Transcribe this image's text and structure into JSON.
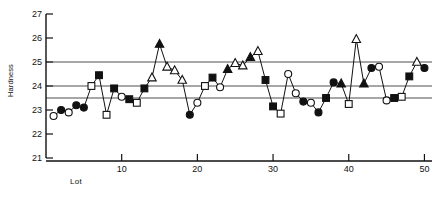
{
  "chart_data": {
    "type": "line",
    "title": "",
    "subtitle": "",
    "xlabel": "Lot",
    "ylabel": "Hardness",
    "xlim": [
      0,
      51
    ],
    "ylim": [
      21,
      27
    ],
    "ytick_labels": [
      "21",
      "22",
      "23",
      "24",
      "25",
      "26",
      "27"
    ],
    "ytick_values": [
      21,
      22,
      23,
      24,
      25,
      26,
      27
    ],
    "xtick_labels": [
      "10",
      "20",
      "30",
      "40",
      "50"
    ],
    "xtick_values": [
      10,
      20,
      30,
      40,
      50
    ],
    "grid": "horizontal-reference-lines-only",
    "legend": "none",
    "reference_lines": [
      {
        "name": "upper-control-limit",
        "value": 25.0
      },
      {
        "name": "center-line",
        "value": 24.0
      },
      {
        "name": "lower-reference-line",
        "value": 23.5
      }
    ],
    "marker_cycle": [
      "open-circle",
      "filled-circle",
      "open-square",
      "filled-square",
      "open-triangle",
      "filled-triangle"
    ],
    "x": [
      1,
      2,
      3,
      4,
      5,
      6,
      7,
      8,
      9,
      10,
      11,
      12,
      13,
      14,
      15,
      16,
      17,
      18,
      19,
      20,
      21,
      22,
      23,
      24,
      25,
      26,
      27,
      28,
      29,
      30,
      31,
      32,
      33,
      34,
      35,
      36,
      37,
      38,
      39,
      40,
      41,
      42,
      43,
      44,
      45,
      46,
      47,
      48,
      49,
      50
    ],
    "values": [
      22.75,
      23.0,
      22.9,
      23.2,
      23.1,
      24.0,
      24.45,
      22.8,
      23.9,
      23.55,
      23.45,
      23.3,
      23.9,
      24.35,
      25.75,
      24.8,
      24.65,
      24.25,
      22.8,
      23.3,
      24.0,
      24.35,
      23.95,
      24.7,
      24.95,
      24.85,
      25.2,
      25.45,
      24.25,
      23.15,
      22.85,
      24.5,
      23.7,
      23.35,
      23.3,
      22.9,
      23.5,
      24.15,
      24.1,
      23.25,
      25.95,
      24.1,
      24.75,
      24.8,
      23.4,
      23.5,
      23.55,
      24.4,
      25.0,
      24.75
    ],
    "markers": [
      "open-circle",
      "filled-circle",
      "open-circle",
      "filled-circle",
      "filled-circle",
      "open-square",
      "filled-square",
      "open-square",
      "filled-square",
      "open-circle",
      "filled-square",
      "open-square",
      "filled-square",
      "open-triangle",
      "filled-triangle",
      "open-triangle",
      "open-triangle",
      "open-triangle",
      "filled-circle",
      "open-circle",
      "open-square",
      "filled-square",
      "open-circle",
      "filled-triangle",
      "open-triangle",
      "open-triangle",
      "filled-triangle",
      "open-triangle",
      "filled-square",
      "filled-square",
      "open-square",
      "open-circle",
      "open-circle",
      "filled-circle",
      "open-circle",
      "filled-circle",
      "filled-square",
      "filled-circle",
      "filled-triangle",
      "open-square",
      "open-triangle",
      "filled-triangle",
      "filled-circle",
      "open-circle",
      "open-circle",
      "filled-square",
      "open-square",
      "filled-square",
      "open-triangle",
      "filled-circle"
    ],
    "series_note": "single connected run sequence with rotating marker symbols"
  },
  "axes": {
    "y_axis_name": "Hardness",
    "x_axis_name": "Lot"
  }
}
